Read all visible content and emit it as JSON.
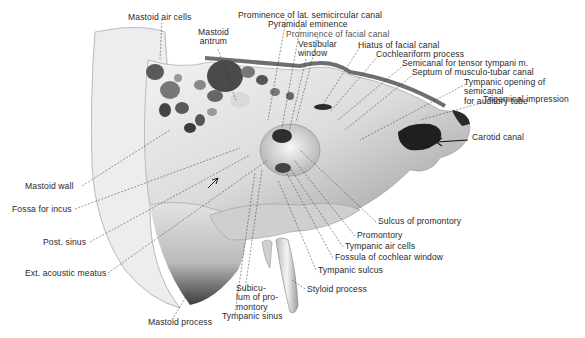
{
  "figure": {
    "labels": [
      {
        "id": "mastoid-air-cells",
        "text": "Mastoid air cells",
        "x": 128,
        "y": 13
      },
      {
        "id": "prominence-lat-semicircular-canal",
        "text": "Prominence of lat. semicircular canal",
        "x": 238,
        "y": 13
      },
      {
        "id": "pyramidal-eminence",
        "text": "Pyramidal eminence",
        "x": 268,
        "y": 22
      },
      {
        "id": "mastoid-antrum",
        "text": "Mastoid\nantrum",
        "x": 200,
        "y": 29
      },
      {
        "id": "prominence-facial-canal",
        "text": "Prominence of facial canal",
        "x": 286,
        "y": 31
      },
      {
        "id": "vestibular-window",
        "text": "Vestibular\nwindow",
        "x": 298,
        "y": 41
      },
      {
        "id": "hiatus-facial-canal",
        "text": "Hiatus of facial canal",
        "x": 358,
        "y": 41
      },
      {
        "id": "cochleariform-process",
        "text": "Cochleariform process",
        "x": 376,
        "y": 50
      },
      {
        "id": "semicanal-tensor-tympani",
        "text": "Semicanal for tensor tympani m.",
        "x": 402,
        "y": 59
      },
      {
        "id": "septum-musculo-tubar",
        "text": "Septum of musculo-tubar canal",
        "x": 412,
        "y": 68
      },
      {
        "id": "tympanic-opening-semicanal",
        "text": "Tympanic opening of semicanal\nfor auditory tube",
        "x": 464,
        "y": 78
      },
      {
        "id": "trigeminal-impression",
        "text": "Trigeminal impression",
        "x": 483,
        "y": 96
      },
      {
        "id": "carotid-canal",
        "text": "Carotid canal",
        "x": 472,
        "y": 133
      },
      {
        "id": "mastoid-wall",
        "text": "Mastoid wall",
        "x": 25,
        "y": 182
      },
      {
        "id": "fossa-for-incus",
        "text": "Fossa for incus",
        "x": 12,
        "y": 205
      },
      {
        "id": "post-sinus",
        "text": "Post. sinus",
        "x": 43,
        "y": 238
      },
      {
        "id": "ext-acoustic-meatus",
        "text": "Ext. acoustic meatus",
        "x": 25,
        "y": 269
      },
      {
        "id": "sulcus-of-promontory",
        "text": "Sulcus of promontory",
        "x": 378,
        "y": 218
      },
      {
        "id": "promontory",
        "text": "Promontory",
        "x": 357,
        "y": 232
      },
      {
        "id": "tympanic-air-cells",
        "text": "Tympanic air cells",
        "x": 345,
        "y": 243
      },
      {
        "id": "fossula-cochlear-window",
        "text": "Fossula of cochlear window",
        "x": 335,
        "y": 254
      },
      {
        "id": "tympanic-sulcus",
        "text": "Tympanic sulcus",
        "x": 318,
        "y": 267
      },
      {
        "id": "styloid-process",
        "text": "Styloid process",
        "x": 307,
        "y": 285
      },
      {
        "id": "subiculum-promontory",
        "text": "Subicu-\nlum of pro-\nmontory",
        "x": 236,
        "y": 285
      },
      {
        "id": "tympanic-sinus",
        "text": "Tympanic sinus",
        "x": 222,
        "y": 312
      },
      {
        "id": "mastoid-process",
        "text": "Mastoid process",
        "x": 148,
        "y": 318
      }
    ],
    "colors": {
      "text": "#2a2a2a",
      "line": "#333333",
      "bone_light": "#e9e9e9",
      "bone_mid": "#bdbdbd",
      "bone_dark": "#3a3a3a",
      "background": "#ffffff"
    }
  }
}
